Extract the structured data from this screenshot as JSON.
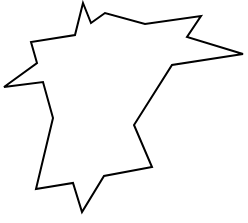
{
  "canvas": {
    "width": 248,
    "height": 223,
    "background": "#ffffff"
  },
  "shape": {
    "type": "polygon",
    "stroke": "#000000",
    "stroke_width": 2,
    "fill": "none",
    "points": [
      [
        83,
        3
      ],
      [
        91,
        23
      ],
      [
        105,
        13
      ],
      [
        145,
        24
      ],
      [
        201,
        16
      ],
      [
        187,
        37
      ],
      [
        243,
        54
      ],
      [
        172,
        65
      ],
      [
        134,
        125
      ],
      [
        152,
        167
      ],
      [
        104,
        176
      ],
      [
        82,
        212
      ],
      [
        73,
        183
      ],
      [
        36,
        189
      ],
      [
        53,
        118
      ],
      [
        43,
        82
      ],
      [
        4,
        87
      ],
      [
        37,
        63
      ],
      [
        31,
        42
      ],
      [
        75,
        35
      ]
    ]
  }
}
